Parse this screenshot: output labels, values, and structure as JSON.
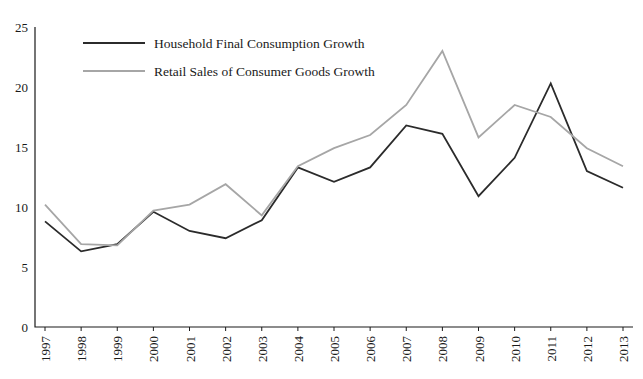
{
  "chart_data": {
    "type": "line",
    "title": "",
    "xlabel": "",
    "ylabel": "",
    "ylim": [
      0,
      25
    ],
    "yticks": [
      0,
      5,
      10,
      15,
      20,
      25
    ],
    "grid": false,
    "legend_position": "top-left",
    "categories": [
      "1997",
      "1998",
      "1999",
      "2000",
      "2001",
      "2002",
      "2003",
      "2004",
      "2005",
      "2006",
      "2007",
      "2008",
      "2009",
      "2010",
      "2011",
      "2012",
      "2013"
    ],
    "series": [
      {
        "name": "Household Final Consumption Growth",
        "color": "#2b2b2b",
        "values": [
          8.8,
          6.3,
          6.9,
          9.6,
          8.0,
          7.4,
          8.9,
          13.3,
          12.1,
          13.3,
          16.8,
          16.1,
          10.9,
          14.1,
          20.3,
          13.0,
          11.6
        ]
      },
      {
        "name": "Retail Sales of Consumer Goods Growth",
        "color": "#a6a6a6",
        "values": [
          10.2,
          6.9,
          6.8,
          9.7,
          10.2,
          11.9,
          9.3,
          13.4,
          14.9,
          16.0,
          18.5,
          23.0,
          15.8,
          18.5,
          17.5,
          14.9,
          13.4
        ]
      }
    ],
    "legend": [
      {
        "label": "Household Final Consumption Growth",
        "color": "#2b2b2b"
      },
      {
        "label": "Retail Sales of Consumer Goods Growth",
        "color": "#a6a6a6"
      }
    ]
  }
}
